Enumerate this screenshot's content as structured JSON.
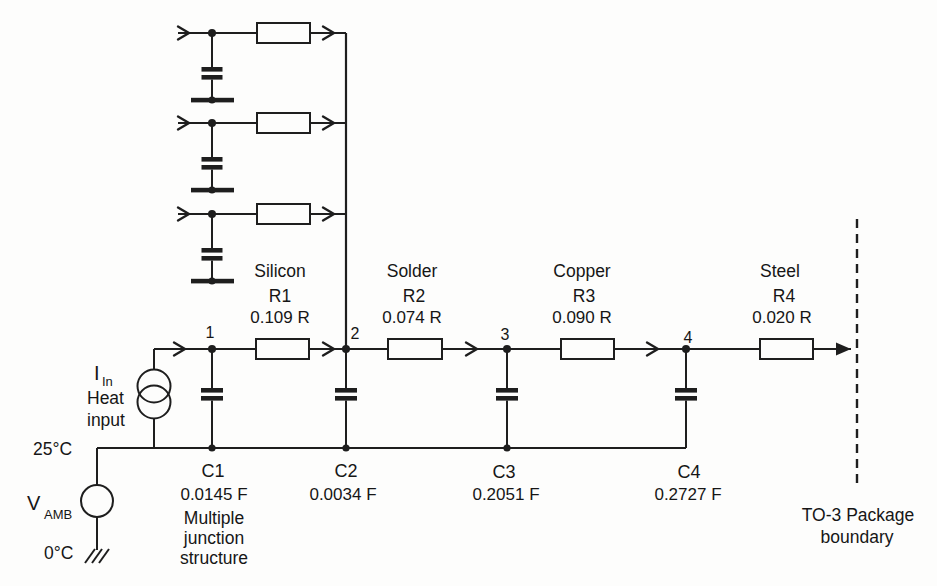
{
  "colors": {
    "ink": "#1e1e1e",
    "paper": "#fdfdfc"
  },
  "stages": [
    {
      "node": "1",
      "material": "Silicon",
      "r_name": "R1",
      "r_value": "0.109 R",
      "c_name": "C1",
      "c_value": "0.0145 F"
    },
    {
      "node": "2",
      "material": "Solder",
      "r_name": "R2",
      "r_value": "0.074 R",
      "c_name": "C2",
      "c_value": "0.0034 F"
    },
    {
      "node": "3",
      "material": "Copper",
      "r_name": "R3",
      "r_value": "0.090 R",
      "c_name": "C3",
      "c_value": "0.2051 F"
    },
    {
      "node": "4",
      "material": "Steel",
      "r_name": "R4",
      "r_value": "0.020 R",
      "c_name": "C4",
      "c_value": "0.2727 F"
    }
  ],
  "heat_source": {
    "symbol_main": "I",
    "symbol_sub": "In",
    "caption_line1": "Heat",
    "caption_line2": "input"
  },
  "ambient_source": {
    "symbol_main": "V",
    "symbol_sub": "AMB",
    "temp_top": "25°C",
    "temp_bottom": "0°C"
  },
  "notes": {
    "junction_line1": "Multiple",
    "junction_line2": "junction",
    "junction_line3": "structure",
    "boundary_line1": "TO-3 Package",
    "boundary_line2": "boundary"
  }
}
